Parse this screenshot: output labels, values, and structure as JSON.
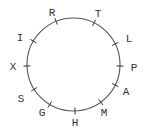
{
  "diagram": {
    "type": "circular-letter-ring",
    "circle": {
      "cx": 73.5,
      "cy": 64.5,
      "r": 46.5
    },
    "stroke_color": "#555555",
    "label_color": "#333333",
    "points": [
      {
        "label": "R",
        "tick": [
          56,
          21
        ],
        "text": [
          52,
          16
        ]
      },
      {
        "label": "T",
        "tick": [
          94,
          23
        ],
        "text": [
          98,
          17
        ]
      },
      {
        "label": "L",
        "tick": [
          115,
          44
        ],
        "text": [
          129,
          42
        ]
      },
      {
        "label": "P",
        "tick": [
          120,
          66
        ],
        "text": [
          134,
          71
        ]
      },
      {
        "label": "A",
        "tick": [
          115,
          85
        ],
        "text": [
          126,
          95
        ]
      },
      {
        "label": "M",
        "tick": [
          100,
          101
        ],
        "text": [
          104,
          116
        ]
      },
      {
        "label": "H",
        "tick": [
          75,
          111
        ],
        "text": [
          75,
          126
        ]
      },
      {
        "label": "G",
        "tick": [
          50,
          104
        ],
        "text": [
          42,
          116
        ]
      },
      {
        "label": "S",
        "tick": [
          33,
          90
        ],
        "text": [
          21,
          102
        ]
      },
      {
        "label": "X",
        "tick": [
          27,
          66
        ],
        "text": [
          13,
          70
        ]
      },
      {
        "label": "I",
        "tick": [
          33,
          41
        ],
        "text": [
          20,
          41
        ]
      }
    ]
  }
}
